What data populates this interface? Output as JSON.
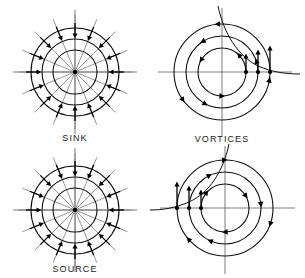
{
  "figure": {
    "title_visible": false,
    "background_color": "#ffffff",
    "ink_color": "#000000",
    "width": 305,
    "height": 278,
    "layout": "2x2 grid of vector-field sketches"
  },
  "panels": [
    {
      "id": "sink",
      "label": "SINK",
      "has_label": true,
      "position": "top-left",
      "center": {
        "x": 75,
        "y": 72
      },
      "type": "radial",
      "ring_count": 3,
      "ring_radii": [
        22,
        33,
        44
      ],
      "spoke_count": 16,
      "spoke_outer_radius": 57,
      "arrow_count": 16,
      "arrow_direction": "inward",
      "arrow_ring_radius": 44,
      "axes": {
        "horizontal": true,
        "vertical": true,
        "half_length": 62
      }
    },
    {
      "id": "vortices",
      "label": "VORTICES",
      "has_label": true,
      "position": "top-right",
      "center": {
        "x": 222,
        "y": 72
      },
      "type": "circulation",
      "ring_count": 3,
      "ring_radii": [
        24,
        36,
        48
      ],
      "arrow_direction": "counterclockwise",
      "arrows_per_ring": 3,
      "axes": {
        "horizontal": true,
        "vertical": true,
        "half_length": 66
      },
      "separatrix": {
        "present": true,
        "quadrant": "upper-right"
      },
      "marker_dots": 3,
      "marker_dot_side": "positive-x",
      "marker_arrow_direction": "up"
    },
    {
      "id": "source",
      "label": "SOURCE",
      "has_label": true,
      "position": "bottom-left",
      "center": {
        "x": 75,
        "y": 210
      },
      "type": "radial",
      "ring_count": 3,
      "ring_radii": [
        22,
        33,
        44
      ],
      "spoke_count": 16,
      "spoke_outer_radius": 57,
      "arrow_count": 16,
      "arrow_direction": "inward",
      "arrow_ring_radius": 44,
      "axes": {
        "horizontal": true,
        "vertical": true,
        "half_length": 62
      }
    },
    {
      "id": "vortices-mirror",
      "label": "",
      "has_label": false,
      "position": "bottom-right",
      "center": {
        "x": 225,
        "y": 208
      },
      "type": "circulation",
      "ring_count": 3,
      "ring_radii": [
        24,
        36,
        48
      ],
      "arrow_direction": "clockwise",
      "arrows_per_ring": 3,
      "axes": {
        "horizontal": true,
        "vertical": true,
        "half_length": 66
      },
      "separatrix": {
        "present": true,
        "quadrant": "upper-left"
      },
      "marker_dots": 3,
      "marker_dot_side": "negative-x",
      "marker_arrow_direction": "up"
    }
  ],
  "labels": {
    "sink": "SINK",
    "vortices": "VORTICES",
    "source": "SOURCE"
  }
}
